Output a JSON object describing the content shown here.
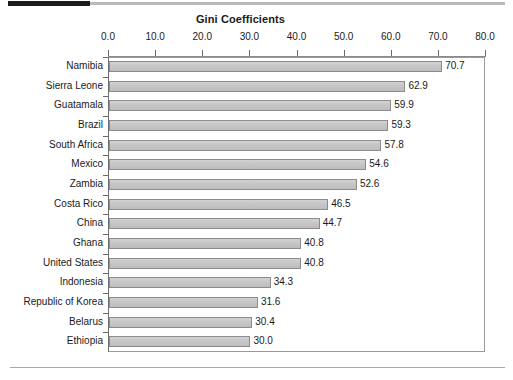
{
  "chart_data": {
    "type": "bar",
    "orientation": "horizontal",
    "title": "Gini Coefficients",
    "xlabel": "",
    "ylabel": "",
    "xlim": [
      0.0,
      80.0
    ],
    "xticks": [
      "0.0",
      "10.0",
      "20.0",
      "30.0",
      "40.0",
      "50.0",
      "60.0",
      "70.0",
      "80.0"
    ],
    "xtick_values": [
      0,
      10,
      20,
      30,
      40,
      50,
      60,
      70,
      80
    ],
    "grid": false,
    "legend": "none",
    "bar_color": "#c9c9c9",
    "bar_border_color": "#8c8c8c",
    "categories": [
      "Namibia",
      "Sierra Leone",
      "Guatamala",
      "Brazil",
      "South Africa",
      "Mexico",
      "Zambia",
      "Costa Rico",
      "China",
      "Ghana",
      "United States",
      "Indonesia",
      "Republic of Korea",
      "Belarus",
      "Ethiopia"
    ],
    "values": [
      70.7,
      62.9,
      59.9,
      59.3,
      57.8,
      54.6,
      52.6,
      46.5,
      44.7,
      40.8,
      40.8,
      34.3,
      31.6,
      30.4,
      30.0
    ],
    "value_labels": [
      "70.7",
      "62.9",
      "59.9",
      "59.3",
      "57.8",
      "54.6",
      "52.6",
      "46.5",
      "44.7",
      "40.8",
      "40.8",
      "34.3",
      "31.6",
      "30.4",
      "30.0"
    ]
  }
}
